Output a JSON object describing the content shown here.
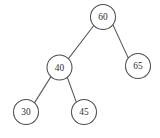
{
  "figure": {
    "background_color": "#ffffff",
    "node_fill_color": "#ffffff",
    "node_stroke_color": "#4d4d4d",
    "edge_color": "#575757",
    "label_color": "#2f2f2f"
  },
  "chart_data": {
    "type": "diagram",
    "diagram_type": "binary-search-tree",
    "title": "",
    "node_radius": 12.5,
    "nodes": [
      {
        "id": "n60",
        "label": "60",
        "cx": 103,
        "cy": 17,
        "role": "root"
      },
      {
        "id": "n40",
        "label": "40",
        "cx": 59.5,
        "cy": 67.5,
        "role": "left-child"
      },
      {
        "id": "n65",
        "label": "65",
        "cx": 138,
        "cy": 66,
        "role": "right-child"
      },
      {
        "id": "n30",
        "label": "30",
        "cx": 26,
        "cy": 112,
        "role": "left-leaf"
      },
      {
        "id": "n45",
        "label": "45",
        "cx": 84,
        "cy": 112,
        "role": "right-leaf"
      }
    ],
    "edges": [
      {
        "id": "e60-40",
        "from": "n60",
        "to": "n40",
        "x1": 93.8,
        "y1": 25.5,
        "x2": 68.3,
        "y2": 58.9
      },
      {
        "id": "e60-65",
        "from": "n60",
        "to": "n65",
        "x1": 112.9,
        "y1": 24.7,
        "x2": 128.6,
        "y2": 58.6
      },
      {
        "id": "e40-30",
        "from": "n40",
        "to": "n30",
        "x1": 50.9,
        "y1": 76.6,
        "x2": 34.3,
        "y2": 103.1
      },
      {
        "id": "e40-45",
        "from": "n40",
        "to": "n45",
        "x1": 67.3,
        "y1": 77.3,
        "x2": 76.4,
        "y2": 102.4
      }
    ],
    "values_in_order": [
      30,
      40,
      45,
      60,
      65
    ],
    "levels": [
      {
        "depth": 0,
        "labels": [
          "60"
        ]
      },
      {
        "depth": 1,
        "labels": [
          "40",
          "65"
        ]
      },
      {
        "depth": 2,
        "labels": [
          "30",
          "45"
        ]
      }
    ]
  }
}
